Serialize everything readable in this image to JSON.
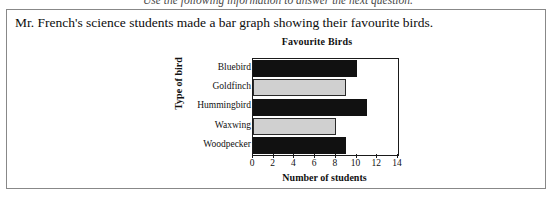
{
  "instruction": {
    "text": "Use the following information to answer the next question."
  },
  "question": {
    "stem": "Mr. French's science students made a bar graph showing their favourite birds."
  },
  "chart_data": {
    "type": "bar",
    "orientation": "horizontal",
    "title": "Favourite Birds",
    "xlabel": "Number of students",
    "ylabel": "Type of bird",
    "categories": [
      "Bluebird",
      "Goldfinch",
      "Hummingbird",
      "Waxwing",
      "Woodpecker"
    ],
    "values": [
      10,
      9,
      11,
      8,
      9
    ],
    "bar_colors": [
      "#111111",
      "#d0d0d0",
      "#111111",
      "#d0d0d0",
      "#111111"
    ],
    "xlim": [
      0,
      14
    ],
    "xticks": [
      0,
      2,
      4,
      6,
      8,
      10,
      12,
      14
    ],
    "xtick_labels": [
      "0",
      "2",
      "4",
      "6",
      "8",
      "10",
      "12",
      "14"
    ],
    "grid": false,
    "legend": false
  }
}
